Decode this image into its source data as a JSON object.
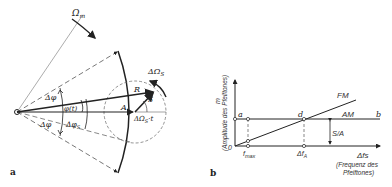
{
  "panel_a": {
    "label": "a",
    "omega_m": "Ω",
    "omega_m_sub": "m",
    "delta_omega_s": "ΔΩ",
    "delta_omega_s_sub": "S",
    "delta_phi_upper": "Δφ",
    "delta_phi_lower": "Δφ",
    "phi_t": "φ(t)",
    "delta_phi_s": "Δφ",
    "delta_phi_s_sub": "S",
    "R": "R",
    "A": "A",
    "S": "S",
    "omega_t": "ΔΩ",
    "omega_t_sub": "S",
    "omega_t_suffix": "·t"
  },
  "panel_b": {
    "label": "b",
    "y_axis_symbol": "m",
    "y_axis_label": "(Amplitude des Pfeiftones)",
    "x_axis_symbol": "Δfs",
    "x_axis_label_line1": "(Frequenz des",
    "x_axis_label_line2": "Pfeiftones)",
    "origin": "0",
    "point_a": "a",
    "point_b": "b",
    "point_d": "d",
    "fm_label": "FM",
    "am_label": "AM",
    "sa_label": "S/A",
    "f_max": "f",
    "f_max_sub": "max",
    "delta_f_a": "Δf",
    "delta_f_a_sub": "A"
  },
  "colors": {
    "stroke": "#222222",
    "dashed": "#555555"
  }
}
